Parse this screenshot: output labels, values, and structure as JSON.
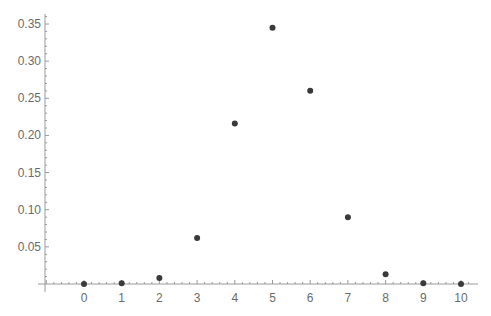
{
  "chart_data": {
    "type": "scatter",
    "title": "",
    "xlabel": "",
    "ylabel": "",
    "x": [
      0,
      1,
      2,
      3,
      4,
      5,
      6,
      7,
      8,
      9,
      10
    ],
    "values": [
      0.0,
      0.001,
      0.008,
      0.062,
      0.216,
      0.345,
      0.26,
      0.09,
      0.013,
      0.001,
      0.0
    ],
    "xlim": [
      -1.2,
      10.3
    ],
    "ylim": [
      0,
      0.36
    ],
    "x_ticks": [
      "0",
      "1",
      "2",
      "3",
      "4",
      "5",
      "6",
      "7",
      "8",
      "9",
      "10"
    ],
    "y_ticks": [
      "0.05",
      "0.10",
      "0.15",
      "0.20",
      "0.25",
      "0.30",
      "0.35"
    ],
    "grid": false,
    "legend": null,
    "colors": {
      "point": "#3a3a3a",
      "axis": "#9a9a9a",
      "text": "#6b6b6b"
    }
  }
}
